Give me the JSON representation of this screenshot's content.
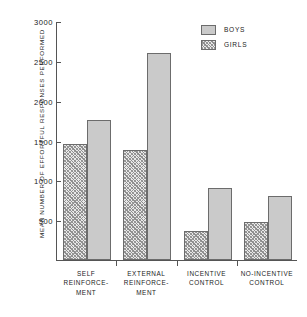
{
  "chart_data": {
    "type": "bar",
    "title": "",
    "subtitle": "",
    "xlabel": "",
    "ylabel": "MEAN NUMBER OF EFFORTFUL RESPONSES PERFORMED",
    "ylim": [
      0,
      3000
    ],
    "ytick_labels": [
      "3000",
      "2500",
      "2000",
      "1500",
      "1000",
      "500"
    ],
    "ytick_values": [
      3000,
      2500,
      2000,
      1500,
      1000,
      500
    ],
    "grid": false,
    "legend_position": "top-right",
    "categories": [
      "SELF REINFORCE- MENT",
      "EXTERNAL REINFORCE- MENT",
      "INCENTIVE CONTROL",
      "NO-INCENTIVE CONTROL"
    ],
    "category_lines": [
      [
        "SELF",
        "REINFORCE-",
        "MENT"
      ],
      [
        "EXTERNAL",
        "REINFORCE-",
        "MENT"
      ],
      [
        "INCENTIVE",
        "CONTROL"
      ],
      [
        "NO-INCENTIVE",
        "CONTROL"
      ]
    ],
    "series": [
      {
        "name": "GIRLS",
        "values": [
          1450,
          1380,
          370,
          480
        ],
        "color": "#e8e8e8",
        "pattern": "hatched"
      },
      {
        "name": "BOYS",
        "values": [
          1760,
          2600,
          910,
          800
        ],
        "color": "#cacaca",
        "pattern": "solid"
      }
    ],
    "legend": [
      {
        "label": "BOYS",
        "pattern": "solid"
      },
      {
        "label": "GIRLS",
        "pattern": "hatched"
      }
    ]
  }
}
